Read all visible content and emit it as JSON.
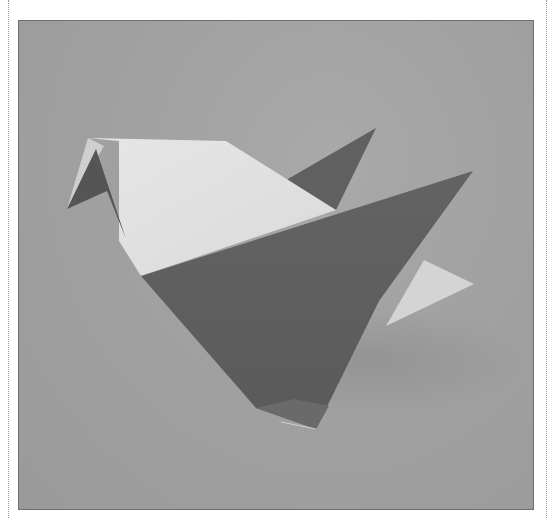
{
  "page": {
    "caption_cropped": "",
    "figure": {
      "subject": "origami-bird-photo",
      "alt": "Photograph of a folded paper origami bird on a grey background",
      "colors": {
        "background": "#a3a3a3",
        "paper_light": "#e2e2e2",
        "paper_dark": "#5f5f5f",
        "paper_mid": "#6e6e6e",
        "shadow": "#8f8f8f",
        "frame": "#6e6e6e"
      }
    }
  }
}
